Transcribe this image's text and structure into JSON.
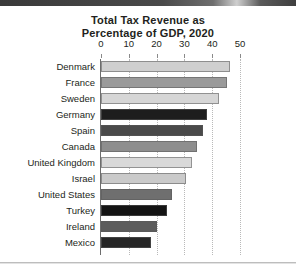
{
  "figure": {
    "title_line1": "Total Tax Revenue as",
    "title_line2": "Percentage of GDP, 2020"
  },
  "chart_data": {
    "type": "bar",
    "orientation": "horizontal",
    "title": "Total Tax Revenue as Percentage of GDP, 2020",
    "xlabel": "",
    "ylabel": "",
    "xlim": [
      0,
      50
    ],
    "xticks": [
      0,
      10,
      20,
      30,
      40,
      50
    ],
    "xtick_labels": [
      "0",
      "10",
      "20",
      "30",
      "40",
      "50"
    ],
    "grid": "vertical-dotted",
    "legend": "none",
    "categories": [
      "Denmark",
      "France",
      "Sweden",
      "Germany",
      "Spain",
      "Canada",
      "United Kingdom",
      "Israel",
      "United States",
      "Turkey",
      "Ireland",
      "Mexico"
    ],
    "values": [
      46.5,
      45.4,
      42.6,
      38.3,
      36.6,
      34.4,
      32.8,
      30.5,
      25.5,
      23.9,
      20.2,
      17.9
    ],
    "colors": [
      "#cfcfcf",
      "#9a9a9a",
      "#d6d6d6",
      "#1d1d1d",
      "#4a4a4a",
      "#8e8e8e",
      "#d9d9d9",
      "#cacaca",
      "#6f6f6f",
      "#141414",
      "#5c5c5c",
      "#262626"
    ]
  }
}
